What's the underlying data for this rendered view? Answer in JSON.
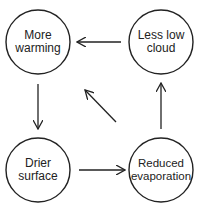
{
  "diagram": {
    "type": "feedback-loop",
    "nodes": [
      {
        "id": "more-warming",
        "label": "More warming"
      },
      {
        "id": "less-low-cloud",
        "label": "Less low cloud"
      },
      {
        "id": "drier-surface",
        "label": "Drier surface"
      },
      {
        "id": "reduced-evaporation",
        "label": "Reduced evaporation"
      }
    ],
    "edges": [
      {
        "from": "less-low-cloud",
        "to": "more-warming"
      },
      {
        "from": "more-warming",
        "to": "drier-surface"
      },
      {
        "from": "drier-surface",
        "to": "reduced-evaporation"
      },
      {
        "from": "reduced-evaporation",
        "to": "less-low-cloud"
      },
      {
        "from": "reduced-evaporation",
        "to": "more-warming"
      }
    ],
    "colors": {
      "stroke": "#222222",
      "background": "#ffffff"
    }
  }
}
